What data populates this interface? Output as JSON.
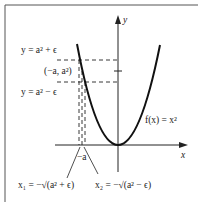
{
  "figure": {
    "function_label": "f(x) = x²",
    "axis_x_label": "x",
    "axis_y_label": "y",
    "labels": {
      "upper_line": "y = a² + ϵ",
      "point": "(−a, a²)",
      "lower_line": "y = a² − ϵ",
      "neg_a": "−a",
      "x1": "x₁ = −√(a² + ϵ)",
      "x2": "x₂ = −√(a² − ϵ)"
    },
    "colors": {
      "ink": "#222222",
      "frame": "#555555",
      "background": "#ffffff"
    }
  }
}
